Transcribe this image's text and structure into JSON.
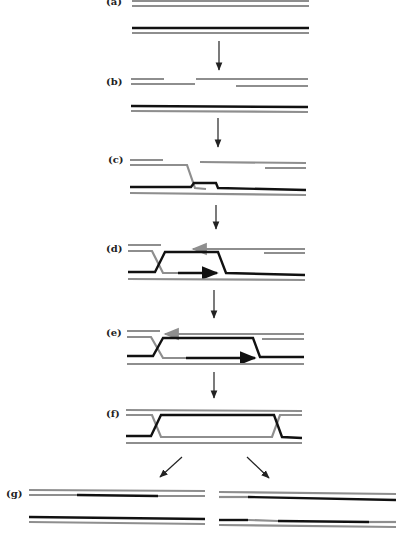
{
  "figure": {
    "type": "diagram",
    "colors": {
      "strand_gray": "#8e8e8e",
      "strand_black": "#111111",
      "arrow": "#222222",
      "background": "#ffffff"
    },
    "panels": [
      {
        "id": "a",
        "label": "(a)"
      },
      {
        "id": "b",
        "label": "(b)"
      },
      {
        "id": "c",
        "label": "(c)"
      },
      {
        "id": "d",
        "label": "(d)"
      },
      {
        "id": "e",
        "label": "(e)"
      },
      {
        "id": "f",
        "label": "(f)"
      },
      {
        "id": "g",
        "label": "(g)"
      }
    ]
  }
}
